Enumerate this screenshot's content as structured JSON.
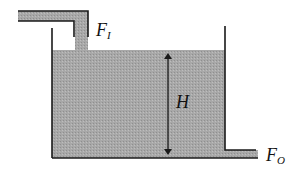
{
  "diagram": {
    "colors": {
      "liquid": "#a6a6a6",
      "wall": "#1a1a1a",
      "background": "#ffffff"
    },
    "labels": {
      "inflow": {
        "main": "F",
        "sub": "I"
      },
      "height": "H",
      "outflow": {
        "main": "F",
        "sub": "O"
      }
    },
    "components": [
      "inlet-pipe",
      "tank",
      "liquid",
      "height-arrow",
      "outlet-pipe"
    ]
  }
}
